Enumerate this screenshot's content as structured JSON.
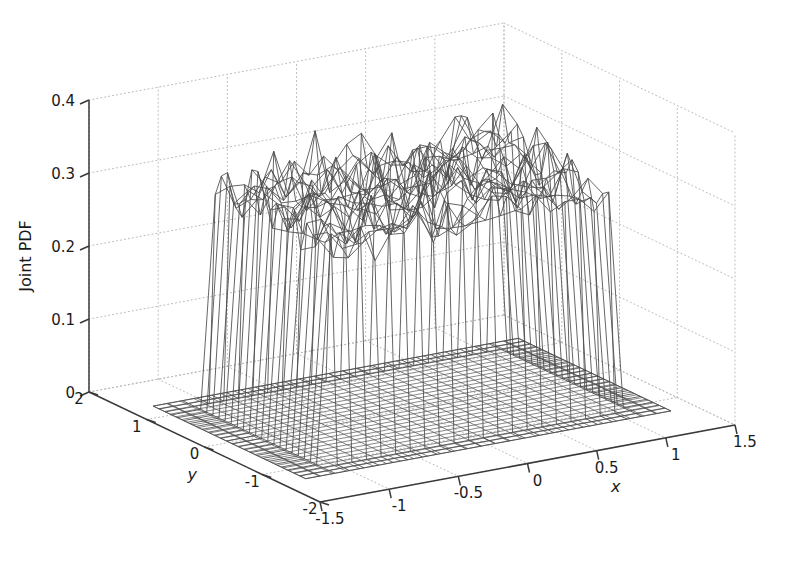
{
  "figure": {
    "width": 787,
    "height": 563,
    "background": "#ffffff",
    "line_color": "#3a3a3a",
    "grid_color": "#b9b9b9",
    "mesh_color": "#4a4a4a",
    "base_mesh_color": "#555555"
  },
  "axes": {
    "x": {
      "label": "x",
      "ticks": [
        "-1.5",
        "-1",
        "-0.5",
        "0",
        "0.5",
        "1",
        "1.5"
      ],
      "tick_values": [
        -1.5,
        -1,
        -0.5,
        0,
        0.5,
        1,
        1.5
      ],
      "limits": [
        -1.5,
        1.5
      ]
    },
    "y": {
      "label": "y",
      "ticks": [
        "2",
        "1",
        "0",
        "-1",
        "-2"
      ],
      "tick_values": [
        2,
        1,
        0,
        -1,
        -2
      ],
      "limits": [
        -2,
        2
      ]
    },
    "z": {
      "label": "Joint PDF",
      "ticks": [
        "0",
        "0.1",
        "0.2",
        "0.3",
        "0.4"
      ],
      "tick_values": [
        0,
        0.1,
        0.2,
        0.3,
        0.4
      ],
      "limits": [
        0,
        0.4
      ]
    }
  },
  "view": {
    "azimuth_deg": -37.5,
    "elevation_deg": 30,
    "grid": "on",
    "grid_style": "dotted",
    "box": "off"
  },
  "chart_data": {
    "type": "surface",
    "title": "",
    "xlabel": "x",
    "ylabel": "y",
    "zlabel": "Joint PDF",
    "xlim": [
      -1.5,
      1.5
    ],
    "ylim": [
      -2,
      2
    ],
    "zlim": [
      0,
      0.4
    ],
    "grid": true,
    "legend": null,
    "support": {
      "x": [
        -1.1,
        1.1
      ],
      "y": [
        -1.1,
        1.1
      ]
    },
    "plateau_mean": 0.3,
    "plateau_range": [
      0.24,
      0.38
    ],
    "baseline": 0.0,
    "grid_n_x": 26,
    "grid_n_y": 26
  }
}
